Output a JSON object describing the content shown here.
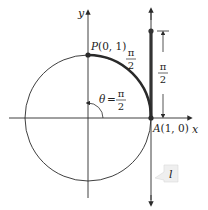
{
  "diagram": {
    "axes": {
      "x_label": "x",
      "y_label": "y"
    },
    "points": {
      "P": {
        "label": "P(0, 1)"
      },
      "A": {
        "label": "A(1, 0)"
      }
    },
    "angle": {
      "theta": "θ =",
      "num": "π",
      "den": "2"
    },
    "arc_label": {
      "num": "π",
      "den": "2"
    },
    "segment_label": {
      "num": "π",
      "den": "2"
    },
    "line_label": "l",
    "colors": {
      "stroke": "#2a2a2a",
      "thick": "#333333",
      "callout": "#f0f0f0"
    }
  }
}
